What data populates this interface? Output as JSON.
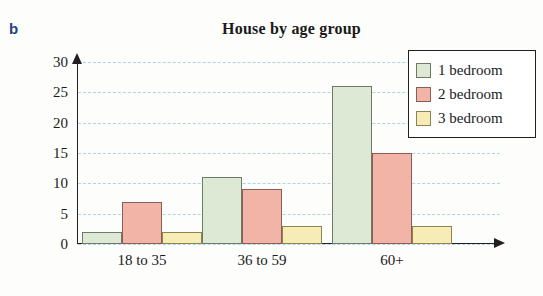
{
  "figure": {
    "part_label": "b"
  },
  "chart_data": {
    "type": "bar",
    "title": "House by age group",
    "xlabel": "",
    "ylabel": "",
    "categories": [
      "18 to 35",
      "36 to 59",
      "60+"
    ],
    "series": [
      {
        "name": "1 bedroom",
        "color": "#dde8d5",
        "values": [
          2,
          11,
          26
        ]
      },
      {
        "name": "2 bedroom",
        "color": "#f3b4a8",
        "values": [
          7,
          9,
          15
        ]
      },
      {
        "name": "3 bedroom",
        "color": "#f7ecb5",
        "values": [
          2,
          3,
          3
        ]
      }
    ],
    "ylim": [
      0,
      30
    ],
    "yticks": [
      0,
      5,
      10,
      15,
      20,
      25,
      30
    ],
    "ytick_labels": [
      "0",
      "5",
      "10",
      "15",
      "20",
      "25",
      "30"
    ],
    "grid": true,
    "grid_color": "#9ecfe8",
    "legend_position": "top-right"
  }
}
